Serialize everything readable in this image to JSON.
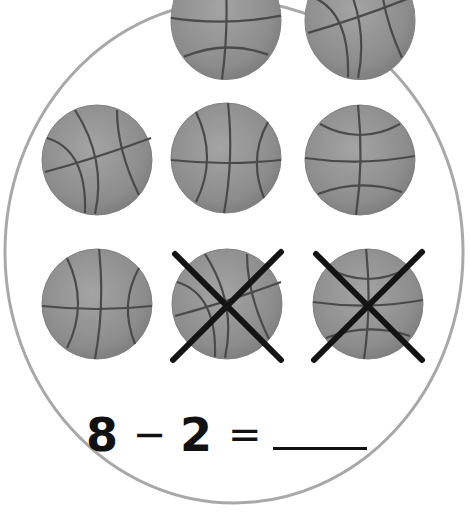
{
  "worksheet": {
    "group_shape": "circle",
    "object_icon": "basketball-icon",
    "total_objects": 8,
    "crossed_out_objects": 2,
    "rows": [
      {
        "row": 1,
        "balls": [
          {
            "crossed": false
          },
          {
            "crossed": false
          }
        ]
      },
      {
        "row": 2,
        "balls": [
          {
            "crossed": false
          },
          {
            "crossed": false
          },
          {
            "crossed": false
          }
        ]
      },
      {
        "row": 3,
        "balls": [
          {
            "crossed": false
          },
          {
            "crossed": true
          },
          {
            "crossed": true
          }
        ]
      }
    ],
    "equation": {
      "minuend": "8",
      "operator": "−",
      "subtrahend": "2",
      "equals": "=",
      "answer": ""
    }
  },
  "colors": {
    "background": "#ffffff",
    "circle_stroke": "#a8a8a8",
    "ball_fill": "#8e8e8e",
    "ball_seam": "#4a4a4a",
    "cross": "#141414",
    "text": "#111111"
  }
}
